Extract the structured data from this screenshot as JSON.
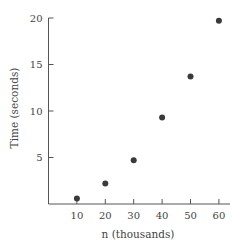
{
  "chart_data": {
    "type": "scatter",
    "title": "",
    "xlabel": "n (thousands)",
    "ylabel": "Time (seconds)",
    "x": [
      10,
      20,
      30,
      40,
      50,
      60
    ],
    "series": [
      {
        "name": "Time",
        "values": [
          0.6,
          2.2,
          4.7,
          9.3,
          13.7,
          19.7
        ]
      }
    ],
    "x_ticks": [
      10,
      20,
      30,
      40,
      50,
      60
    ],
    "y_ticks": [
      5,
      10,
      15,
      20
    ],
    "xlim": [
      0,
      64
    ],
    "ylim": [
      0,
      20
    ],
    "grid": false,
    "legend": "none",
    "colors": {
      "marker": "#3a3a3a",
      "axis": "#555555",
      "text": "#444444"
    }
  }
}
